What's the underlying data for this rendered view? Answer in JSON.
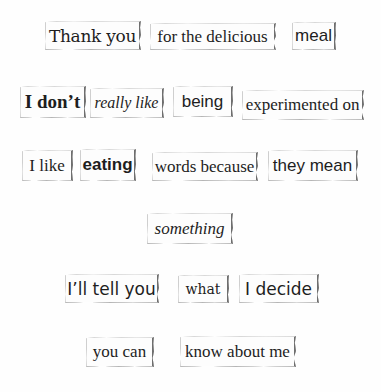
{
  "scene": {
    "background": "#fefefe",
    "tile_color": "#fdfdfd",
    "text_color": "#1e1e1e"
  },
  "rows": [
    {
      "tiles": [
        {
          "text": "Thank you",
          "style": "slab-serif"
        },
        {
          "text": "for the delicious",
          "style": "serif"
        },
        {
          "text": "meal",
          "style": "sans"
        }
      ]
    },
    {
      "tiles": [
        {
          "text": "I don’t",
          "style": "serif-bold"
        },
        {
          "text": "really like",
          "style": "serif-italic"
        },
        {
          "text": "being",
          "style": "sans"
        },
        {
          "text": "experimented on",
          "style": "serif"
        }
      ]
    },
    {
      "tiles": [
        {
          "text": "I like",
          "style": "serif"
        },
        {
          "text": "eating",
          "style": "sans-bold"
        },
        {
          "text": "words because",
          "style": "serif"
        },
        {
          "text": "they mean",
          "style": "sans"
        }
      ]
    },
    {
      "tiles": [
        {
          "text": "something",
          "style": "serif-italic"
        }
      ]
    },
    {
      "tiles": [
        {
          "text": "I’ll tell you",
          "style": "sans"
        },
        {
          "text": "what",
          "style": "serif"
        },
        {
          "text": "I decide",
          "style": "sans"
        }
      ]
    },
    {
      "tiles": [
        {
          "text": "you can",
          "style": "serif"
        },
        {
          "text": "know about me",
          "style": "serif"
        }
      ]
    }
  ]
}
